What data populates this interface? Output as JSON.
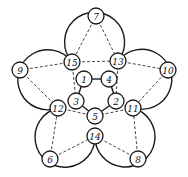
{
  "diagram": {
    "type": "pentagram-circle-graph",
    "colors": {
      "stroke": "#1a1a1a",
      "background": "#ffffff"
    },
    "nodes": [
      {
        "id": "7",
        "label": "7",
        "x": 96,
        "y": 16
      },
      {
        "id": "15",
        "label": "15",
        "x": 72,
        "y": 62
      },
      {
        "id": "13",
        "label": "13",
        "x": 118,
        "y": 61
      },
      {
        "id": "9",
        "label": "9",
        "x": 20,
        "y": 70
      },
      {
        "id": "10",
        "label": "10",
        "x": 168,
        "y": 70
      },
      {
        "id": "1",
        "label": "1",
        "x": 84,
        "y": 79
      },
      {
        "id": "4",
        "label": "4",
        "x": 109,
        "y": 79
      },
      {
        "id": "3",
        "label": "3",
        "x": 76,
        "y": 101
      },
      {
        "id": "12",
        "label": "12",
        "x": 58,
        "y": 108
      },
      {
        "id": "2",
        "label": "2",
        "x": 116,
        "y": 101
      },
      {
        "id": "11",
        "label": "11",
        "x": 133,
        "y": 108
      },
      {
        "id": "5",
        "label": "5",
        "x": 95,
        "y": 116
      },
      {
        "id": "14",
        "label": "14",
        "x": 95,
        "y": 136
      },
      {
        "id": "6",
        "label": "6",
        "x": 50,
        "y": 159
      },
      {
        "id": "8",
        "label": "8",
        "x": 138,
        "y": 159
      }
    ],
    "dashed_edges": [
      [
        "7",
        "15"
      ],
      [
        "7",
        "13"
      ],
      [
        "9",
        "15"
      ],
      [
        "13",
        "10"
      ],
      [
        "15",
        "13"
      ],
      [
        "9",
        "12"
      ],
      [
        "10",
        "11"
      ],
      [
        "12",
        "5"
      ],
      [
        "11",
        "5"
      ],
      [
        "6",
        "12"
      ],
      [
        "8",
        "11"
      ],
      [
        "6",
        "14"
      ],
      [
        "8",
        "14"
      ],
      [
        "15",
        "3"
      ],
      [
        "13",
        "2"
      ]
    ],
    "solid_edges": [
      [
        "1",
        "4"
      ],
      [
        "1",
        "3"
      ],
      [
        "4",
        "2"
      ],
      [
        "3",
        "5"
      ],
      [
        "2",
        "5"
      ]
    ]
  }
}
